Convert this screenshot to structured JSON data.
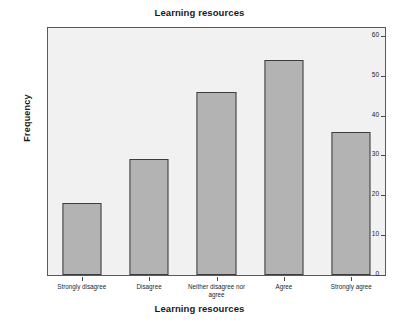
{
  "chart_data": {
    "type": "bar",
    "title": "Learning resources",
    "xlabel": "Learning resources",
    "ylabel": "Frequency",
    "categories": [
      "Strongly disagree",
      "Disagree",
      "Neither disagree nor agree",
      "Agree",
      "Strongly agree"
    ],
    "values": [
      18,
      29,
      46,
      54,
      36
    ],
    "ylim": [
      0,
      62
    ],
    "yticks": [
      0,
      10,
      20,
      30,
      40,
      50,
      60
    ],
    "ytick_labels": [
      "0",
      "10",
      "20",
      "30",
      "40",
      "50",
      "60"
    ],
    "grid": false,
    "legend": "none",
    "series": [
      {
        "name": "Frequency",
        "values": [
          18,
          29,
          46,
          54,
          36
        ]
      }
    ]
  },
  "style": {
    "bar_fill": "#b3b3b3",
    "bar_border": "#3d3d3d",
    "plot_background": "#f1f1f1",
    "frame_border": "#5a5a5a",
    "text_color": "#1a1a1a",
    "page_background": "#ffffff"
  }
}
